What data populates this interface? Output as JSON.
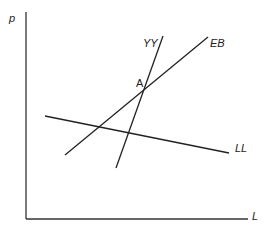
{
  "diagram": {
    "axes": {
      "y_label": "p",
      "x_label": "L",
      "origin": [
        26,
        219
      ],
      "y_top": [
        26,
        12
      ],
      "x_end": [
        248,
        219
      ],
      "color": "#333333"
    },
    "curves": [
      {
        "id": "YY",
        "label": "YY",
        "from": [
          116,
          168
        ],
        "to": [
          163,
          36
        ]
      },
      {
        "id": "EB",
        "label": "EB",
        "from": [
          65,
          155
        ],
        "to": [
          208,
          37
        ]
      },
      {
        "id": "LL",
        "label": "LL",
        "from": [
          45,
          116
        ],
        "to": [
          229,
          153
        ]
      }
    ],
    "points": [
      {
        "id": "A",
        "label": "A",
        "at": [
          146,
          87
        ]
      }
    ],
    "line_color": "#222222"
  }
}
